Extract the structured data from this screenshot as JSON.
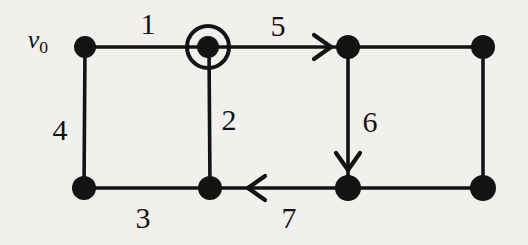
{
  "figure": {
    "background_color": "#f2f0ed",
    "ink_color": "#131313",
    "width": 528,
    "height": 245
  },
  "vertices": [
    {
      "id": "top-left",
      "name": "vertex-top-left",
      "x": 85,
      "y": 47,
      "radius": 11,
      "highlighted": false
    },
    {
      "id": "top-mid-left",
      "name": "vertex-top-mid-left",
      "x": 208,
      "y": 47,
      "radius": 11,
      "highlighted": true,
      "ring_radius": 21,
      "ring_width": 4
    },
    {
      "id": "top-mid-right",
      "name": "vertex-top-mid-right",
      "x": 348,
      "y": 47,
      "radius": 12,
      "highlighted": false
    },
    {
      "id": "top-right",
      "name": "vertex-top-right",
      "x": 483,
      "y": 47,
      "radius": 12,
      "highlighted": false
    },
    {
      "id": "bot-left",
      "name": "vertex-bottom-left",
      "x": 84,
      "y": 188,
      "radius": 12,
      "highlighted": false
    },
    {
      "id": "bot-mid-left",
      "name": "vertex-bottom-mid-left",
      "x": 210,
      "y": 188,
      "radius": 12,
      "highlighted": false
    },
    {
      "id": "bot-mid-right",
      "name": "vertex-bottom-mid-right",
      "x": 348,
      "y": 188,
      "radius": 13,
      "highlighted": false
    },
    {
      "id": "bot-right",
      "name": "vertex-bottom-right",
      "x": 483,
      "y": 188,
      "radius": 13,
      "highlighted": false
    }
  ],
  "edges": [
    {
      "label": "1",
      "name": "edge-1",
      "from": "top-left",
      "to": "top-mid-left",
      "x1": 85,
      "y1": 47,
      "x2": 208,
      "y2": 47,
      "label_x": 148,
      "label_y": 24,
      "arrow": "none"
    },
    {
      "label": "2",
      "name": "edge-2",
      "from": "top-mid-left",
      "to": "bot-mid-left",
      "x1": 209,
      "y1": 47,
      "x2": 210,
      "y2": 188,
      "label_x": 229,
      "label_y": 120,
      "arrow": "none"
    },
    {
      "label": "3",
      "name": "edge-3",
      "from": "bot-left",
      "to": "bot-mid-left",
      "x1": 84,
      "y1": 188,
      "x2": 210,
      "y2": 188,
      "label_x": 143,
      "label_y": 218,
      "arrow": "none"
    },
    {
      "label": "4",
      "name": "edge-4",
      "from": "top-left",
      "to": "bot-left",
      "x1": 85,
      "y1": 47,
      "x2": 84,
      "y2": 188,
      "label_x": 60,
      "label_y": 130,
      "arrow": "none"
    },
    {
      "label": "5",
      "name": "edge-5",
      "from": "top-mid-left",
      "to": "top-mid-right",
      "x1": 208,
      "y1": 47,
      "x2": 348,
      "y2": 47,
      "label_x": 278,
      "label_y": 26,
      "arrow": "right",
      "arrow_x": 331,
      "arrow_y": 47
    },
    {
      "label": "6",
      "name": "edge-6",
      "from": "top-mid-right",
      "to": "bot-mid-right",
      "x1": 348,
      "y1": 47,
      "x2": 348,
      "y2": 188,
      "label_x": 370,
      "label_y": 122,
      "arrow": "down",
      "arrow_x": 348,
      "arrow_y": 170
    },
    {
      "label": "7",
      "name": "edge-7",
      "from": "bot-mid-right",
      "to": "bot-mid-left",
      "x1": 348,
      "y1": 188,
      "x2": 210,
      "y2": 188,
      "label_x": 289,
      "label_y": 218,
      "arrow": "left",
      "arrow_x": 248,
      "arrow_y": 188
    }
  ],
  "unlabeled_edges": [
    {
      "name": "edge-top-right-segment",
      "x1": 348,
      "y1": 47,
      "x2": 483,
      "y2": 47
    },
    {
      "name": "edge-right-side-segment",
      "x1": 483,
      "y1": 47,
      "x2": 483,
      "y2": 188
    },
    {
      "name": "edge-bottom-right-segment",
      "x1": 348,
      "y1": 188,
      "x2": 483,
      "y2": 188
    }
  ],
  "vertex_labels": [
    {
      "name": "vertex-label-v0",
      "text": "v",
      "subscript": "0",
      "x": 38,
      "y": 42,
      "for_vertex": "top-left"
    }
  ],
  "chart_data": {
    "type": "diagram",
    "title": "",
    "graph_kind": "undirected graph with traversal direction arrows",
    "node_count": 8,
    "edge_labels": [
      "1",
      "2",
      "3",
      "4",
      "5",
      "6",
      "7"
    ],
    "arrow_directions": {
      "5": "right",
      "6": "down",
      "7": "left"
    },
    "start_vertex": "v0",
    "marked_vertex": "top-mid-left"
  }
}
